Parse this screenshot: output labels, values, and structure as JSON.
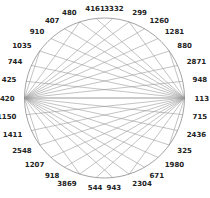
{
  "diagram": {
    "type": "circular-chord",
    "center": [
      104.5,
      98
    ],
    "radius": 80,
    "line_color": "#9a9a9a",
    "circle_color": "#8c8c8c",
    "hubs": [
      {
        "name": "right-hub",
        "angle_deg": 0
      },
      {
        "name": "left-hub",
        "angle_deg": 180
      }
    ],
    "nodes_clockwise_from_top": [
      "480",
      "4161",
      "3332",
      "299",
      "1260",
      "1281",
      "880",
      "2871",
      "948",
      "1134",
      "715",
      "2436",
      "325",
      "1980",
      "671",
      "2304",
      "943",
      "544",
      "3869",
      "918",
      "1207",
      "2548",
      "1411",
      "1150",
      "3420",
      "425",
      "744",
      "1035",
      "910",
      "407"
    ]
  }
}
